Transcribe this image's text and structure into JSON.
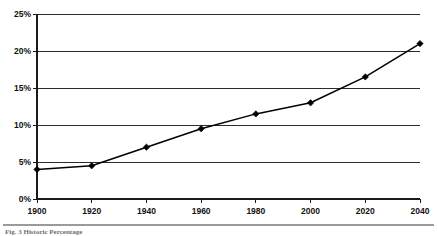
{
  "chart_data": {
    "type": "line",
    "title": "",
    "subtitle": "",
    "xlabel": "",
    "ylabel": "",
    "x": [
      1900,
      1920,
      1940,
      1960,
      1980,
      2000,
      2020,
      2040
    ],
    "categories": [
      "1900",
      "1920",
      "1940",
      "1960",
      "1980",
      "2000",
      "2020",
      "2040"
    ],
    "values": [
      4,
      4.5,
      7,
      9.5,
      11.5,
      13,
      16.5,
      21
    ],
    "series": [
      {
        "name": "",
        "values": [
          4,
          4.5,
          7,
          9.5,
          11.5,
          13,
          16.5,
          21
        ]
      }
    ],
    "ylim": [
      0,
      25
    ],
    "xlim": [
      1900,
      2040
    ],
    "y_ticks": [
      0,
      5,
      10,
      15,
      20,
      25
    ],
    "y_tick_labels": [
      "0%",
      "5%",
      "10%",
      "15%",
      "20%",
      "25%"
    ],
    "x_ticks": [
      1900,
      1920,
      1940,
      1960,
      1980,
      2000,
      2020,
      2040
    ],
    "x_tick_labels": [
      "1900",
      "1920",
      "1940",
      "1960",
      "1980",
      "2000",
      "2020",
      "2040"
    ],
    "grid": true,
    "grid_axis": "y",
    "legend": false,
    "legend_position": "none",
    "marker": "diamond",
    "line_color": "#000000",
    "marker_color": "#000000",
    "grid_color": "#2b2b2b",
    "background_color": "#ffffff",
    "annotations": []
  },
  "footer": {
    "rule_color": "#9a9a9a",
    "caption": "Fig. 3  Historic Percentage"
  }
}
